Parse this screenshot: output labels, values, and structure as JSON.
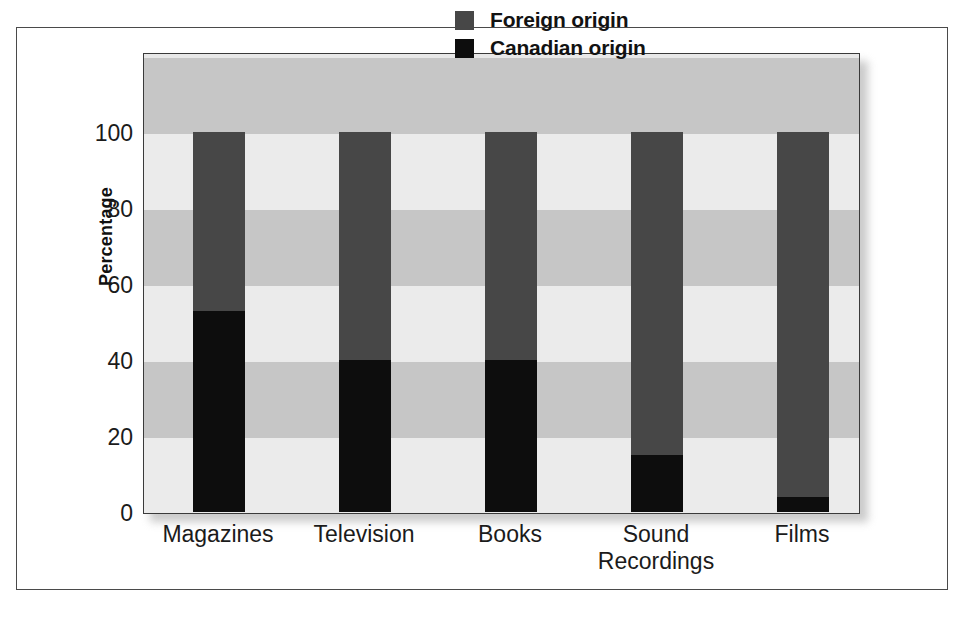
{
  "chart_data": {
    "type": "bar",
    "subtype": "stacked-100-percent",
    "title": "",
    "xlabel": "",
    "ylabel": "Percentage",
    "ylim": [
      0,
      100
    ],
    "yticks": [
      0,
      20,
      40,
      60,
      80,
      100
    ],
    "categories": [
      "Magazines",
      "Television",
      "Books",
      "Sound Recordings",
      "Films"
    ],
    "category_lines": [
      [
        "Magazines"
      ],
      [
        "Television"
      ],
      [
        "Books"
      ],
      [
        "Sound",
        "Recordings"
      ],
      [
        "Films"
      ]
    ],
    "series": [
      {
        "name": "Canadian origin",
        "color": "#0d0d0d",
        "values": [
          53,
          40,
          40,
          15,
          4
        ]
      },
      {
        "name": "Foreign origin",
        "color": "#474747",
        "values": [
          47,
          60,
          60,
          85,
          96
        ]
      }
    ],
    "legend": {
      "position": "top-right-inside",
      "entries": [
        {
          "label": "Foreign origin",
          "color": "#474747"
        },
        {
          "label": "Canadian origin",
          "color": "#0d0d0d"
        }
      ]
    },
    "grid": false,
    "bands": "alternating horizontal grey bands every 20 percentage points",
    "panel_background": "#e8e8e8",
    "band_dark_color": "#c6c6c6",
    "band_light_color": "#ebebeb"
  }
}
